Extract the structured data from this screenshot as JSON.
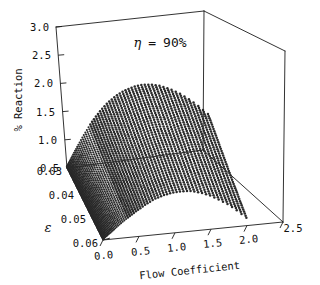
{
  "chart_data": {
    "type": "scatter",
    "projection": "3d-surface-mesh",
    "title": "",
    "annotation": "η  =  90%",
    "annotation_symbol": "η",
    "annotation_value": "90%",
    "xlabel": "Flow Coefficient",
    "ylabel": "ε",
    "zlabel": "% Reaction",
    "xlim": [
      0.0,
      2.5
    ],
    "ylim": [
      0.03,
      0.06
    ],
    "zlim": [
      0.5,
      3.0
    ],
    "grid": false,
    "legend": false,
    "marker": "filled-circle",
    "marker_color": "#2a2a2a",
    "background": "#ffffff",
    "xticks": [
      "0.0",
      "0.5",
      "1.0",
      "1.5",
      "2.0",
      "2.5"
    ],
    "xtick_values": [
      0.0,
      0.5,
      1.0,
      1.5,
      2.0,
      2.5
    ],
    "yticks": [
      "0.03",
      "0.04",
      "0.05",
      "0.06"
    ],
    "ytick_values": [
      0.03,
      0.04,
      0.05,
      0.06
    ],
    "zticks": [
      "0.5",
      "1.0",
      "1.5",
      "2.0",
      "2.5",
      "3.0"
    ],
    "ztick_values": [
      0.5,
      1.0,
      1.5,
      2.0,
      2.5,
      3.0
    ],
    "surface_description": "Dome-shaped mesh of discrete dots rising from a dense convergence point near Flow Coefficient 0.0 and fanning outward and upward toward higher flow coefficient and lower epsilon.",
    "series": [
      {
        "name": "% Reaction surface",
        "eps_rows": [
          0.03,
          0.0325,
          0.035,
          0.0375,
          0.04,
          0.0425,
          0.045,
          0.0475,
          0.05,
          0.0525,
          0.055,
          0.0575,
          0.06
        ],
        "flow_cols": [
          0.0,
          0.125,
          0.25,
          0.375,
          0.5,
          0.625,
          0.75,
          0.875,
          1.0,
          1.125,
          1.25,
          1.375,
          1.5,
          1.625,
          1.75,
          1.875,
          2.0
        ],
        "values": [
          [
            0.52,
            0.78,
            1.02,
            1.24,
            1.42,
            1.57,
            1.68,
            1.76,
            1.81,
            1.83,
            1.82,
            1.78,
            1.71,
            1.62,
            1.5,
            1.36,
            1.2
          ],
          [
            0.52,
            0.76,
            0.99,
            1.2,
            1.38,
            1.53,
            1.64,
            1.72,
            1.77,
            1.79,
            1.78,
            1.74,
            1.67,
            1.58,
            1.46,
            1.32,
            1.16
          ],
          [
            0.52,
            0.75,
            0.96,
            1.16,
            1.34,
            1.48,
            1.59,
            1.67,
            1.72,
            1.74,
            1.73,
            1.69,
            1.62,
            1.53,
            1.41,
            1.27,
            1.11
          ],
          [
            0.52,
            0.73,
            0.93,
            1.12,
            1.29,
            1.43,
            1.54,
            1.62,
            1.67,
            1.69,
            1.68,
            1.64,
            1.57,
            1.48,
            1.36,
            1.22,
            1.06
          ],
          [
            0.52,
            0.72,
            0.91,
            1.09,
            1.25,
            1.39,
            1.49,
            1.57,
            1.62,
            1.64,
            1.63,
            1.59,
            1.52,
            1.43,
            1.31,
            1.17,
            1.01
          ],
          [
            0.52,
            0.7,
            0.88,
            1.05,
            1.21,
            1.34,
            1.44,
            1.52,
            1.57,
            1.58,
            1.57,
            1.53,
            1.47,
            1.38,
            1.26,
            1.12,
            0.96
          ],
          [
            0.52,
            0.69,
            0.86,
            1.02,
            1.17,
            1.29,
            1.39,
            1.47,
            1.51,
            1.53,
            1.52,
            1.48,
            1.42,
            1.32,
            1.21,
            1.07,
            0.91
          ],
          [
            0.52,
            0.68,
            0.84,
            0.99,
            1.13,
            1.25,
            1.35,
            1.42,
            1.46,
            1.48,
            1.47,
            1.43,
            1.36,
            1.27,
            1.16,
            1.02,
            0.86
          ],
          [
            0.52,
            0.67,
            0.82,
            0.96,
            1.09,
            1.21,
            1.3,
            1.37,
            1.41,
            1.42,
            1.41,
            1.37,
            1.31,
            1.22,
            1.11,
            0.97,
            0.81
          ],
          [
            0.52,
            0.66,
            0.8,
            0.93,
            1.06,
            1.17,
            1.26,
            1.32,
            1.36,
            1.37,
            1.36,
            1.32,
            1.26,
            1.17,
            1.06,
            0.92,
            0.77
          ],
          [
            0.52,
            0.65,
            0.78,
            0.91,
            1.02,
            1.13,
            1.21,
            1.27,
            1.31,
            1.32,
            1.31,
            1.27,
            1.21,
            1.12,
            1.01,
            0.88,
            0.72
          ],
          [
            0.52,
            0.64,
            0.77,
            0.88,
            0.99,
            1.09,
            1.17,
            1.23,
            1.26,
            1.27,
            1.26,
            1.22,
            1.16,
            1.07,
            0.96,
            0.83,
            0.68
          ],
          [
            0.52,
            0.63,
            0.75,
            0.86,
            0.96,
            1.05,
            1.13,
            1.18,
            1.21,
            1.22,
            1.21,
            1.17,
            1.11,
            1.02,
            0.92,
            0.79,
            0.64
          ]
        ]
      }
    ]
  }
}
